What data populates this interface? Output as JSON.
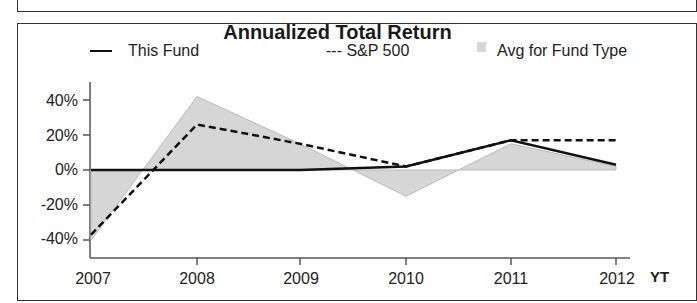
{
  "chart_data": {
    "type": "line",
    "title": "Annualized Total Return",
    "xlabel": "",
    "ylabel": "",
    "categories": [
      "2007",
      "2008",
      "2009",
      "2010",
      "2011",
      "2012"
    ],
    "extra_x_label": "YT",
    "ylim": [
      -50,
      50
    ],
    "yticks": [
      "40%",
      "20%",
      "0%",
      "-20%",
      "-40%"
    ],
    "grid": false,
    "legend_position": "top",
    "series": [
      {
        "name": "This Fund",
        "style": "solid-line",
        "values": [
          0,
          0,
          0,
          2,
          17,
          3
        ]
      },
      {
        "name": "--- S&P 500",
        "style": "dashed-line",
        "values": [
          -37,
          26,
          15,
          2,
          17,
          17
        ]
      },
      {
        "name": "Avg for Fund Type",
        "style": "shaded-area",
        "values": [
          -40,
          42,
          15,
          -15,
          15,
          2
        ]
      }
    ]
  },
  "legend": {
    "this_fund": "This Fund",
    "sp500": "--- S&P 500",
    "avg": "Avg for Fund Type"
  },
  "colors": {
    "this_fund": "#111111",
    "sp500": "#111111",
    "avg_fill": "#d6d6d6"
  }
}
